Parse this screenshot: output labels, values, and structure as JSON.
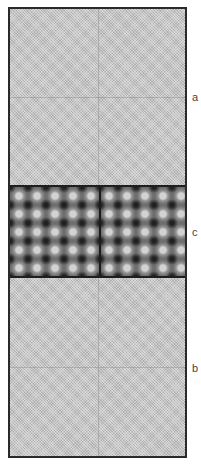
{
  "figure": {
    "regions": [
      {
        "id": "a",
        "label": "a",
        "pattern": "fine uniform stipple (light gray)"
      },
      {
        "id": "c",
        "label": "c",
        "pattern": "periodic blob / lattice texture (dark with light spots)"
      },
      {
        "id": "b",
        "label": "b",
        "pattern": "fine uniform stipple (light gray)"
      }
    ],
    "colors": {
      "frame": "#2a2a2a",
      "light_region": "#c4c4c4",
      "band_region": "#6e6e6e",
      "label_text": "#444444"
    }
  }
}
